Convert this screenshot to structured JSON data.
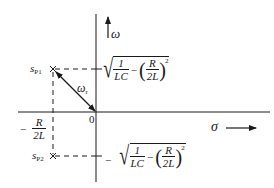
{
  "diagram": {
    "type": "s-plane pole plot",
    "axes": {
      "vertical_label": "ω",
      "horizontal_label": "σ",
      "origin_label": "0"
    },
    "poles": [
      {
        "name": "s",
        "subscript": "P1",
        "position": "upper-left"
      },
      {
        "name": "s",
        "subscript": "P2",
        "position": "lower-left"
      }
    ],
    "vector_label": {
      "symbol": "ω",
      "subscript": "r"
    },
    "real_part_label": {
      "sign": "−",
      "numerator": "R",
      "denominator": "2L"
    },
    "imag_upper_label": {
      "sign": "",
      "frac1_num": "1",
      "frac1_den": "LC",
      "minus": "−",
      "frac2_num": "R",
      "frac2_den": "2L",
      "exponent": "2"
    },
    "imag_lower_label": {
      "sign": "−",
      "frac1_num": "1",
      "frac1_den": "LC",
      "minus": "−",
      "frac2_num": "R",
      "frac2_den": "2L",
      "exponent": "2"
    },
    "colors": {
      "ink": "#1a1a1a",
      "background": "#ffffff"
    }
  }
}
